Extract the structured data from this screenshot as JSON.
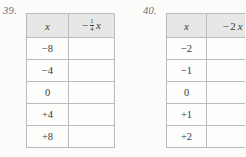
{
  "page": {
    "background_color": "#fbfbfa",
    "text_color": "#3b3b3b",
    "rule_color": "#b9bcbd",
    "header_fill": "#e7e7e6"
  },
  "problems": [
    {
      "number_label": "39.",
      "columns": [
        {
          "header_text": "x",
          "kind": "variable"
        },
        {
          "header_text": "-1/4x",
          "kind": "expression",
          "minus": "−",
          "numerator": "1",
          "denominator": "4",
          "variable": "x"
        }
      ],
      "rows": [
        {
          "input": "−8",
          "output": ""
        },
        {
          "input": "−4",
          "output": ""
        },
        {
          "input": "0",
          "output": ""
        },
        {
          "input": "+4",
          "output": ""
        },
        {
          "input": "+8",
          "output": ""
        }
      ]
    },
    {
      "number_label": "40.",
      "columns": [
        {
          "header_text": "x",
          "kind": "variable"
        },
        {
          "header_text": "-2x",
          "kind": "expression",
          "minus": "−",
          "coefficient": "2",
          "variable": "x"
        }
      ],
      "rows": [
        {
          "input": "−2",
          "output": ""
        },
        {
          "input": "−1",
          "output": ""
        },
        {
          "input": "0",
          "output": ""
        },
        {
          "input": "+1",
          "output": ""
        },
        {
          "input": "+2",
          "output": ""
        }
      ]
    }
  ]
}
